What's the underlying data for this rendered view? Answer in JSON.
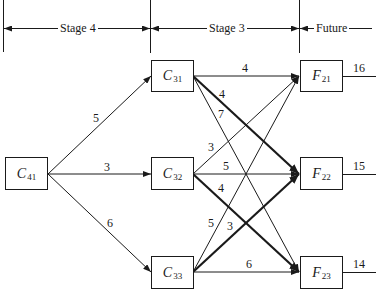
{
  "stages": [
    {
      "label": "Stage 4"
    },
    {
      "label": "Stage 3"
    },
    {
      "label": "Future"
    }
  ],
  "nodes": {
    "C41": {
      "letter": "C",
      "sub": "41"
    },
    "C31": {
      "letter": "C",
      "sub": "31"
    },
    "C32": {
      "letter": "C",
      "sub": "32"
    },
    "C33": {
      "letter": "C",
      "sub": "33"
    },
    "F21": {
      "letter": "F",
      "sub": "21"
    },
    "F22": {
      "letter": "F",
      "sub": "22"
    },
    "F23": {
      "letter": "F",
      "sub": "23"
    }
  },
  "edges": [
    {
      "from": "C41",
      "to": "C31",
      "weight": "5",
      "bold": false
    },
    {
      "from": "C41",
      "to": "C32",
      "weight": "3",
      "bold": false
    },
    {
      "from": "C41",
      "to": "C33",
      "weight": "6",
      "bold": false
    },
    {
      "from": "C31",
      "to": "F21",
      "weight": "4",
      "bold": false
    },
    {
      "from": "C31",
      "to": "F22",
      "weight": "4",
      "bold": true
    },
    {
      "from": "C31",
      "to": "F23",
      "weight": "7",
      "bold": false
    },
    {
      "from": "C32",
      "to": "F21",
      "weight": "3",
      "bold": false
    },
    {
      "from": "C32",
      "to": "F22",
      "weight": "5",
      "bold": false
    },
    {
      "from": "C32",
      "to": "F23",
      "weight": "4",
      "bold": true
    },
    {
      "from": "C33",
      "to": "F21",
      "weight": "5",
      "bold": false
    },
    {
      "from": "C33",
      "to": "F22",
      "weight": "3",
      "bold": true
    },
    {
      "from": "C33",
      "to": "F23",
      "weight": "6",
      "bold": false
    }
  ],
  "future_values": {
    "F21": "16",
    "F22": "15",
    "F23": "14"
  }
}
